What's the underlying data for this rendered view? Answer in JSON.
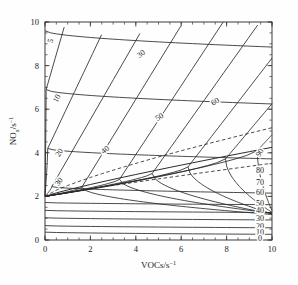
{
  "chart_data": {
    "type": "line",
    "subtype": "contour-isopleth",
    "title": "",
    "xlabel": "VOCs/s⁻¹",
    "ylabel": "NOₓ/s⁻¹",
    "xlim": [
      0,
      10
    ],
    "ylim": [
      0,
      10
    ],
    "xticks": [
      "0",
      "2",
      "4",
      "6",
      "8",
      "10"
    ],
    "yticks": [
      "0",
      "2",
      "4",
      "6",
      "8",
      "10"
    ],
    "xtick_values": [
      0,
      2,
      4,
      6,
      8,
      10
    ],
    "ytick_values": [
      0,
      2,
      4,
      6,
      8,
      10
    ],
    "minor_ticks_per_interval": 4,
    "grid": false,
    "legend": "none",
    "contour_levels": [
      5,
      10,
      20,
      30,
      40,
      50,
      60,
      70,
      80,
      90
    ],
    "ridge_origin": [
      0,
      2
    ],
    "inline_labels": [
      {
        "text": "5",
        "x": 0.35,
        "y": 9.1,
        "rotate": -72
      },
      {
        "text": "10",
        "x": 0.62,
        "y": 6.45,
        "rotate": -63
      },
      {
        "text": "20",
        "x": 0.72,
        "y": 3.95,
        "rotate": -57
      },
      {
        "text": "30",
        "x": 0.7,
        "y": 2.6,
        "rotate": -52
      },
      {
        "text": "30",
        "x": 4.3,
        "y": 8.45,
        "rotate": -36
      },
      {
        "text": "40",
        "x": 2.72,
        "y": 4.05,
        "rotate": -38
      },
      {
        "text": "50",
        "x": 5.1,
        "y": 5.55,
        "rotate": -34
      },
      {
        "text": "60",
        "x": 7.55,
        "y": 6.25,
        "rotate": -32
      },
      {
        "text": "90",
        "x": 9.55,
        "y": 3.95,
        "rotate": -58
      }
    ],
    "edge_labels": [
      {
        "text": "80",
        "y": 3.22
      },
      {
        "text": "70",
        "y": 2.68
      },
      {
        "text": "60",
        "y": 2.22
      },
      {
        "text": "50",
        "y": 1.72
      },
      {
        "text": "40",
        "y": 1.36
      },
      {
        "text": "30",
        "y": 1.02
      },
      {
        "text": "20",
        "y": 0.66
      },
      {
        "text": "10",
        "y": 0.36
      },
      {
        "text": "0",
        "y": 0.1
      }
    ],
    "colors": {
      "line": "#2b2b2b",
      "axis": "#3a3a3a",
      "background": "#fefefe"
    }
  }
}
